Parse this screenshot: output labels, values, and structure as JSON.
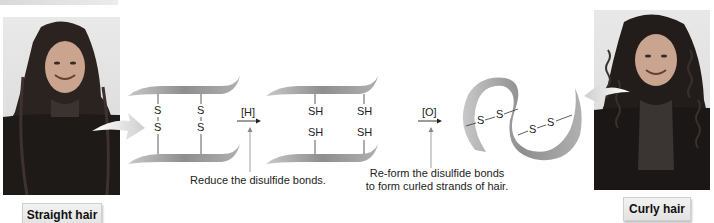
{
  "figure": {
    "left_photo": {
      "caption": "Straight hair",
      "subject": "woman-with-straight-hair"
    },
    "right_photo": {
      "caption": "Curly hair",
      "subject": "woman-with-curly-hair"
    },
    "step1": {
      "reagent": "[H]",
      "caption": "Reduce the disulfide bonds.",
      "before_atoms": [
        "S",
        "S",
        "S",
        "S"
      ],
      "after_atoms": [
        "SH",
        "SH",
        "SH",
        "SH"
      ]
    },
    "step2": {
      "reagent": "[O]",
      "caption_line1": "Re-form the disulfide bonds",
      "caption_line2": "to form curled strands of hair.",
      "bond_labels": [
        "S",
        "S",
        "S",
        "S"
      ]
    },
    "colors": {
      "ribbon": "#8e8e8e",
      "ribbon_light": "#c9c9c9",
      "arrow_fill": "#d5d5d5",
      "caption_box": "#e8e8e8",
      "text": "#222222"
    }
  }
}
